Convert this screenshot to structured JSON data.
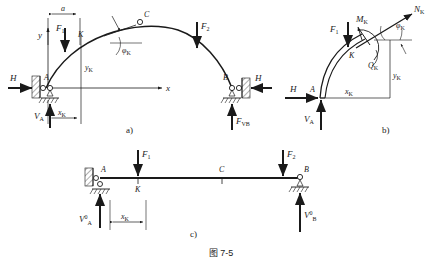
{
  "figure": {
    "caption": "图  7-5",
    "panels": [
      {
        "tag": "a)",
        "name": "three-hinged-arch-loaded",
        "labels": {
          "dim_a": "a",
          "axis_y": "y",
          "axis_x": "x",
          "force_F1": "F",
          "force_F1_sub": "1",
          "force_F2": "F",
          "force_F2_sub": "2",
          "point_A": "A",
          "point_B": "B",
          "point_C": "C",
          "point_K": "K",
          "thrust_left": "H",
          "thrust_right": "H",
          "reaction_left": "V",
          "reaction_left_sub": "A",
          "reaction_right": "F",
          "reaction_right_sub": "VB",
          "ordinate_yK": "y",
          "ordinate_yK_sub": "K",
          "abscissa_xK": "x",
          "abscissa_xK_sub": "K",
          "angle_phiK": "φ",
          "angle_phiK_sub": "K"
        }
      },
      {
        "tag": "b)",
        "name": "free-body-segment-AK",
        "labels": {
          "force_F1": "F",
          "force_F1_sub": "1",
          "moment_MK": "M",
          "moment_MK_sub": "K",
          "axial_NK": "N",
          "axial_NK_sub": "K",
          "shear_QK": "Q",
          "shear_QK_sub": "K",
          "angle_phiK": "φ",
          "angle_phiK_sub": "K",
          "point_A": "A",
          "point_K": "K",
          "thrust_H": "H",
          "reaction_VA": "V",
          "reaction_VA_sub": "A",
          "ordinate_yK": "y",
          "ordinate_yK_sub": "K",
          "abscissa_xK": "x",
          "abscissa_xK_sub": "K"
        }
      },
      {
        "tag": "c)",
        "name": "equivalent-simply-supported-beam",
        "labels": {
          "force_F1": "F",
          "force_F1_sub": "1",
          "force_F2": "F",
          "force_F2_sub": "2",
          "point_A": "A",
          "point_B": "B",
          "point_C": "C",
          "point_K": "K",
          "reaction_left": "V",
          "reaction_left_sub": "A",
          "reaction_left_sup": "0",
          "reaction_right": "V",
          "reaction_right_sub": "B",
          "reaction_right_sup": "0",
          "abscissa_xK": "x",
          "abscissa_xK_sub": "K"
        }
      }
    ]
  },
  "colors": {
    "ink": "#1a1a1a",
    "line": "#2b2b2b",
    "background": "#ffffff"
  }
}
